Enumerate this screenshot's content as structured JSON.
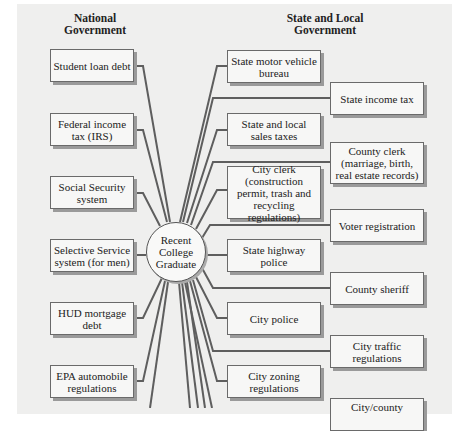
{
  "headings": {
    "national": "National Government",
    "state_local": "State and Local Government"
  },
  "center": {
    "label": "Recent College Graduate"
  },
  "national_boxes": [
    {
      "label": "Student loan debt"
    },
    {
      "label": "Federal income tax (IRS)"
    },
    {
      "label": "Social Security system"
    },
    {
      "label": "Selective Service system (for men)"
    },
    {
      "label": "HUD mortgage debt"
    },
    {
      "label": "EPA automobile regulations"
    }
  ],
  "state_inner_boxes": [
    {
      "label": "State motor vehicle bureau"
    },
    {
      "label": "State and local sales taxes"
    },
    {
      "label": "City clerk (construction permit, trash and recycling regulations)"
    },
    {
      "label": "State highway police"
    },
    {
      "label": "City police"
    },
    {
      "label": "City zoning regulations"
    }
  ],
  "state_outer_boxes": [
    {
      "label": "State income tax"
    },
    {
      "label": "County clerk (marriage, birth, real estate records)"
    },
    {
      "label": "Voter registration"
    },
    {
      "label": "County sheriff"
    },
    {
      "label": "City traffic regulations"
    },
    {
      "label": "City/county"
    }
  ],
  "colors": {
    "panel": "#efefee",
    "box_fill": "#f7f7f6",
    "box_border": "#6a6a6a",
    "line": "#5a5a5a"
  }
}
